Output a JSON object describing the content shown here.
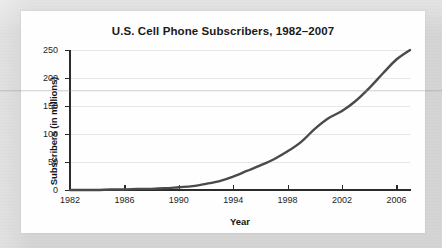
{
  "card": {
    "background_color": "#fefefe",
    "page_background_color": "#d4d4d4"
  },
  "chart_data": {
    "type": "line",
    "title": "U.S. Cell Phone Subscribers, 1982–2007",
    "xlabel": "Year",
    "ylabel": "Subscribers (in millions)",
    "xlim": [
      1982,
      2007
    ],
    "ylim": [
      0,
      250
    ],
    "grid": true,
    "legend": null,
    "legend_position": "none",
    "line_color": "#4a4a4a",
    "grid_color": "#e6e6e6",
    "axis_color": "#2b2b2b",
    "y_ticks": [
      0,
      50,
      100,
      150,
      200,
      250
    ],
    "y_tick_labels": [
      "0",
      "50",
      "100",
      "150",
      "200",
      "250"
    ],
    "x_ticks": [
      1982,
      1986,
      1990,
      1994,
      1998,
      2002,
      2006
    ],
    "x_tick_labels": [
      "1982",
      "1986",
      "1990",
      "1994",
      "1998",
      "2002",
      "2006"
    ],
    "x": [
      1982,
      1983,
      1984,
      1985,
      1986,
      1987,
      1988,
      1989,
      1990,
      1991,
      1992,
      1993,
      1994,
      1995,
      1996,
      1997,
      1998,
      1999,
      2000,
      2001,
      2002,
      2003,
      2004,
      2005,
      2006,
      2007
    ],
    "values": [
      0,
      0,
      0,
      1,
      1,
      2,
      2,
      3,
      5,
      7,
      11,
      16,
      24,
      34,
      44,
      55,
      69,
      86,
      109,
      128,
      141,
      159,
      182,
      208,
      233,
      250
    ],
    "series": [
      {
        "name": "U.S. cell phone subscribers",
        "values": [
          0,
          0,
          0,
          1,
          1,
          2,
          2,
          3,
          5,
          7,
          11,
          16,
          24,
          34,
          44,
          55,
          69,
          86,
          109,
          128,
          141,
          159,
          182,
          208,
          233,
          250
        ]
      }
    ]
  }
}
